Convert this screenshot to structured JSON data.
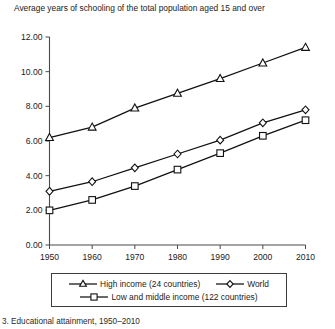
{
  "chart_data": {
    "type": "line",
    "title": "Average years of schooling of the total population aged 15 and over",
    "xlabel": "",
    "ylabel": "",
    "x": [
      1950,
      1960,
      1970,
      1980,
      1990,
      2000,
      2010
    ],
    "xticklabels": [
      "1950",
      "1960",
      "1970",
      "1980",
      "1990",
      "2000",
      "2010"
    ],
    "yticklabels": [
      "0.00",
      "2.00",
      "4.00",
      "6.00",
      "8.00",
      "10.00",
      "12.00"
    ],
    "yticks": [
      0,
      2,
      4,
      6,
      8,
      10,
      12
    ],
    "xlim": [
      1950,
      2010
    ],
    "ylim": [
      0,
      12
    ],
    "grid": false,
    "legend_position": "below",
    "series": [
      {
        "name": "High income (24 countries)",
        "marker": "triangle",
        "values": [
          6.2,
          6.8,
          7.9,
          8.75,
          9.6,
          10.5,
          11.4
        ]
      },
      {
        "name": "World",
        "marker": "diamond",
        "values": [
          3.1,
          3.65,
          4.45,
          5.25,
          6.05,
          7.05,
          7.8
        ]
      },
      {
        "name": "Low and middle income (122 countries)",
        "marker": "square",
        "values": [
          2.0,
          2.6,
          3.4,
          4.35,
          5.3,
          6.3,
          7.2
        ]
      }
    ]
  },
  "legend": {
    "rows": [
      [
        "High income (24 countries)",
        "World"
      ],
      [
        "Low and middle income (122 countries)"
      ]
    ]
  },
  "caption": "3. Educational attainment, 1950–2010",
  "colors": {
    "line": "#111111",
    "marker_fill": "#ffffff",
    "axis": "#4a4a4a",
    "text": "#1b1b1b"
  }
}
